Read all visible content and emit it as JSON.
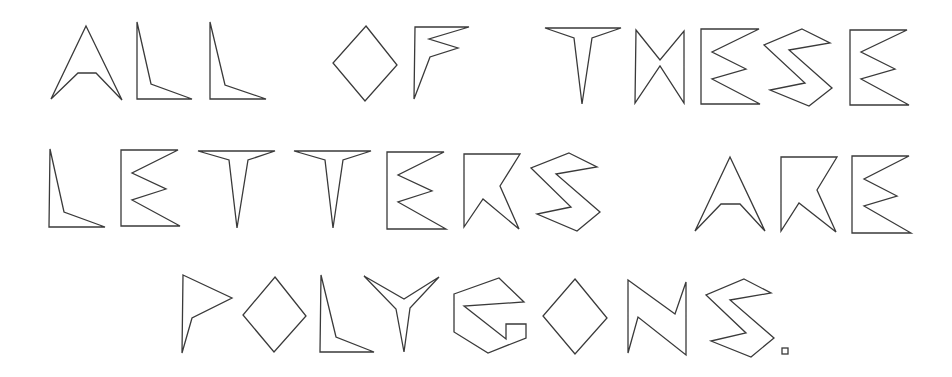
{
  "text": "ALL OF THESE LETTERS ARE POLYGONS.",
  "lines": [
    {
      "text": "ALL OF THESE",
      "glyphs": [
        {
          "char": "A",
          "points": "86,26 122,100 96,73 78,73 51,99"
        },
        {
          "char": "L",
          "points": "137,22 151,84 192,99 137,99"
        },
        {
          "char": "L",
          "points": "210,22 225,85 266,99 210,99"
        },
        {
          "char": "O",
          "points": "366,26 397,65 365,101 333,63"
        },
        {
          "char": "F",
          "points": "415,27 469,27 429,39 458,48 430,57 414,99"
        },
        {
          "char": "T",
          "points": "545,28 621,28 592,38 582,104 574,38"
        },
        {
          "char": "H",
          "points": "636,30 660,60 684,31 684,103 660,66 635,103"
        },
        {
          "char": "E",
          "points": "701,29 759,29 712,52 746,69 712,79 760,104 701,104"
        },
        {
          "char": "S",
          "points": "802,29 830,43 789,50 832,88 809,106 770,90 805,83 764,45"
        },
        {
          "char": "E",
          "points": "850,30 907,30 861,52 895,69 861,79 909,105 850,105"
        }
      ]
    },
    {
      "text": "LETTERS ARE",
      "glyphs": [
        {
          "char": "L",
          "points": "50,149 64,212 105,227 49,227"
        },
        {
          "char": "E",
          "points": "121,150 178,150 132,173 166,189 132,200 180,226 121,226"
        },
        {
          "char": "T",
          "points": "198,151 275,151 248,160 237,228 229,160"
        },
        {
          "char": "T",
          "points": "294,151 371,151 343,160 333,228 325,160"
        },
        {
          "char": "E",
          "points": "387,152 444,152 398,175 432,191 398,202 446,229 387,229"
        },
        {
          "char": "R",
          "points": "464,154 520,154 500,186 519,229 483,199 464,227"
        },
        {
          "char": "S",
          "points": "569,153 597,167 556,174 600,212 577,231 537,214 571,207 531,168"
        },
        {
          "char": "A",
          "points": "730,157 765,231 740,204 721,204 695,231"
        },
        {
          "char": "R",
          "points": "781,157 837,157 817,190 836,232 799,203 781,231"
        },
        {
          "char": "E",
          "points": "852,156 909,156 864,179 897,196 864,206 911,233 852,233"
        }
      ]
    },
    {
      "text": "POLYGONS.",
      "glyphs": [
        {
          "char": "P",
          "points": "183,275 232,298 192,318 182,353"
        },
        {
          "char": "O",
          "points": "275,277 306,316 274,352 243,315"
        },
        {
          "char": "L",
          "points": "321,275 336,337 374,352 320,352"
        },
        {
          "char": "Y",
          "points": "364,276 404,299 439,277 410,308 404,352 396,309"
        },
        {
          "char": "G",
          "points": "454,294 499,278 524,302 464,306 506,339 506,324 526,324 526,338 488,353 454,332"
        },
        {
          "char": "O",
          "points": "575,279 607,318 575,354 543,316"
        },
        {
          "char": "N",
          "points": "628,280 675,314 686,282 686,355 638,317 628,353"
        },
        {
          "char": "S",
          "points": "744,279 771,293 730,300 774,338 751,357 711,341 746,333 706,295"
        }
      ],
      "period": {
        "x": 782,
        "y": 348,
        "size": 6
      }
    }
  ],
  "colors": {
    "stroke": "#3a3a3a",
    "background": "#ffffff"
  }
}
